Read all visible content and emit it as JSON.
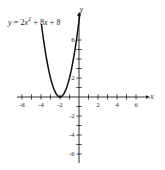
{
  "figure": {
    "background_color": "#ffffff",
    "ink_color": "#1a1a1a",
    "equation_label": {
      "lhs": "y",
      "equals": "=",
      "coefficient_a": "2",
      "var": "x",
      "exponent": "2",
      "plus1": "+",
      "coefficient_b": "8",
      "var2": "x",
      "plus2": "+",
      "constant_c": "8",
      "full_text": "y = 2x² + 8x + 8"
    },
    "axis_names": {
      "x": "x",
      "y": "y"
    }
  },
  "chart_data": {
    "type": "line",
    "title": "",
    "subtitle": "",
    "xlabel": "x",
    "ylabel": "y",
    "annotations": [
      "y = 2x² + 8x + 8"
    ],
    "equation": "y = 2x^2 + 8x + 8",
    "grid": false,
    "legend": "none",
    "xlim": [
      -6.6,
      6.6
    ],
    "ylim": [
      -6.6,
      6.6
    ],
    "xticks": [
      -6,
      -5,
      -4,
      -3,
      -2,
      -1,
      1,
      2,
      3,
      4,
      5,
      6
    ],
    "yticks": [
      -6,
      -5,
      -4,
      -3,
      -2,
      -1,
      1,
      2,
      3,
      4,
      5,
      6
    ],
    "xtick_labels": [
      "-6",
      "-4",
      "-2",
      "2",
      "4",
      "6"
    ],
    "xtick_label_values": [
      -6,
      -4,
      -2,
      2,
      4,
      6
    ],
    "ytick_labels": [
      "6",
      "2",
      "-2",
      "-4",
      "-6"
    ],
    "ytick_label_values": [
      6,
      2,
      -2,
      -4,
      -6
    ],
    "vertex": {
      "x": -2,
      "y": 0
    },
    "y_intercept": {
      "x": 0,
      "y": 8
    },
    "roots": [
      -2
    ],
    "series": [
      {
        "name": "y = 2x² + 8x + 8",
        "color": "#111111",
        "x": [
          -3.95,
          -3.8,
          -3.6,
          -3.4,
          -3.2,
          -3.0,
          -2.8,
          -2.6,
          -2.4,
          -2.2,
          -2.0,
          -1.8,
          -1.6,
          -1.4,
          -1.2,
          -1.0,
          -0.8,
          -0.6,
          -0.4,
          -0.2,
          0.0,
          0.1
        ],
        "values": [
          7.605,
          6.48,
          5.12,
          3.92,
          2.88,
          2.0,
          1.28,
          0.72,
          0.32,
          0.08,
          0.0,
          0.08,
          0.32,
          0.72,
          1.28,
          2.0,
          2.88,
          3.92,
          5.12,
          6.48,
          8.0,
          8.82
        ]
      }
    ]
  }
}
